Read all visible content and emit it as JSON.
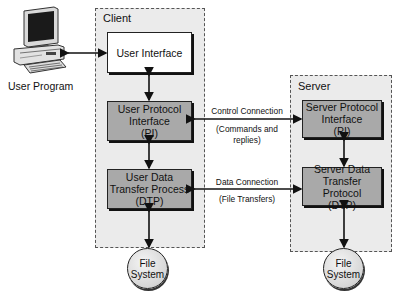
{
  "user_program": {
    "label": "User Program",
    "icon": "desktop-computer-icon"
  },
  "client": {
    "label": "Client",
    "user_interface": {
      "label": "User Interface"
    },
    "protocol_interface": {
      "line1": "User Protocol",
      "line2": "Interface",
      "line3": "(PI)"
    },
    "data_transfer": {
      "line1": "User Data",
      "line2": "Transfer Process",
      "line3": "(DTP)"
    },
    "file_system": {
      "line1": "File",
      "line2": "System"
    }
  },
  "server": {
    "label": "Server",
    "protocol_interface": {
      "line1": "Server Protocol",
      "line2": "Interface",
      "line3": "(PI)"
    },
    "data_transfer": {
      "line1": "Server Data",
      "line2": "Transfer Protocol",
      "line3": "(DTP)"
    },
    "file_system": {
      "line1": "File",
      "line2": "System"
    }
  },
  "connections": {
    "control": {
      "label": "Control Connection",
      "sublabel": "(Commands and replies)"
    },
    "data": {
      "label": "Data Connection",
      "sublabel": "(File Transfers)"
    }
  },
  "colors": {
    "region_fill": "#ebebeb",
    "box_gray": "#a9a9a9",
    "box_white": "#ffffff",
    "stroke": "#222222"
  }
}
